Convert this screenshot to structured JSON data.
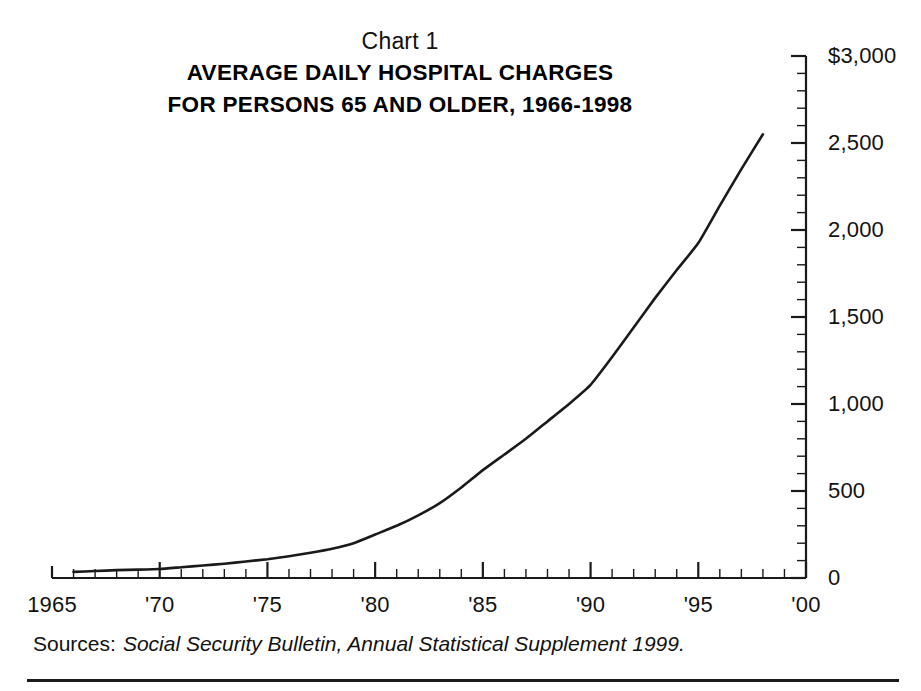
{
  "chart_data": {
    "type": "line",
    "chart_number": "Chart 1",
    "title": "AVERAGE DAILY HOSPITAL CHARGES",
    "subtitle": "FOR PERSONS 65 AND OLDER, 1966-1998",
    "title_full": "AVERAGE DAILY HOSPITAL CHARGES FOR PERSONS 65 AND OLDER, 1966-1998",
    "xlabel": "",
    "ylabel": "",
    "xlim": [
      1965,
      2000
    ],
    "ylim": [
      0,
      3000
    ],
    "grid": false,
    "legend": false,
    "line_color": "#1a1a1a",
    "x_tick_labels": [
      "1965",
      "'70",
      "'75",
      "'80",
      "'85",
      "'90",
      "'95",
      "'00"
    ],
    "x_tick_values": [
      1965,
      1970,
      1975,
      1980,
      1985,
      1990,
      1995,
      2000
    ],
    "x_minor_tick_interval": 1,
    "y_tick_labels": [
      "$3,000",
      "2,500",
      "2,000",
      "1,500",
      "1,000",
      "500",
      "0"
    ],
    "y_tick_values": [
      3000,
      2500,
      2000,
      1500,
      1000,
      500,
      0
    ],
    "y_minor_tick_interval": 100,
    "series": [
      {
        "name": "Average daily hospital charge",
        "x": [
          1966,
          1967,
          1968,
          1969,
          1970,
          1971,
          1972,
          1973,
          1974,
          1975,
          1976,
          1977,
          1978,
          1979,
          1980,
          1981,
          1982,
          1983,
          1984,
          1985,
          1986,
          1987,
          1988,
          1989,
          1990,
          1991,
          1992,
          1993,
          1994,
          1995,
          1996,
          1997,
          1998
        ],
        "values": [
          35,
          40,
          45,
          48,
          52,
          62,
          72,
          82,
          95,
          108,
          125,
          145,
          168,
          200,
          250,
          300,
          360,
          430,
          520,
          620,
          710,
          800,
          900,
          1000,
          1110,
          1270,
          1440,
          1610,
          1770,
          1925,
          2140,
          2350,
          2550
        ]
      }
    ],
    "source_label": "Sources:",
    "source_text": "Social Security Bulletin, Annual Statistical Supplement 1999."
  }
}
